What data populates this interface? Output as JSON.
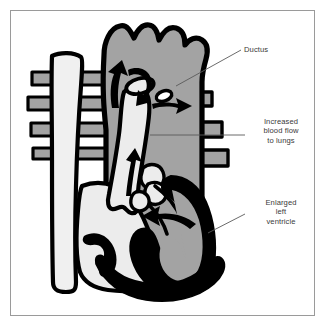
{
  "figure": {
    "border_color": "#9a9a9a",
    "background_color": "#ffffff"
  },
  "palette": {
    "outline": "#000000",
    "muscle_gray": "#a3a3a3",
    "chamber_light": "#ececec",
    "vessel_light": "#f0f0f0",
    "text": "#3a3a3a",
    "leader_line": "#5a5a5a"
  },
  "callouts": [
    {
      "id": "ductus",
      "text": "Ductus",
      "lines": [
        "Ductus"
      ]
    },
    {
      "id": "blood-flow",
      "text": "Increased\nblood flow\nto lungs",
      "lines": [
        "Increased",
        "blood flow",
        "to lungs"
      ]
    },
    {
      "id": "left-ventricle",
      "text": "Enlarged\nleft\nventricle",
      "lines": [
        "Enlarged",
        "left",
        "ventricle"
      ]
    }
  ],
  "anatomy": {
    "aortic_arch": "aortic-arch",
    "superior_vena_cava": "superior-vena-cava",
    "pulmonary_artery": "pulmonary-artery",
    "left_ventricle": "enlarged-left-ventricle",
    "right_ventricle": "right-ventricle",
    "ductus_arteriosus": "ductus-arteriosus"
  },
  "flow_arrows": [
    {
      "id": "arrow-aorta-up",
      "direction": "up-left"
    },
    {
      "id": "arrow-ductus-down",
      "direction": "down"
    },
    {
      "id": "arrow-ductus-right",
      "direction": "right"
    },
    {
      "id": "arrow-pulmonary-up",
      "direction": "up"
    },
    {
      "id": "arrow-ventricle-left",
      "direction": "left"
    }
  ]
}
